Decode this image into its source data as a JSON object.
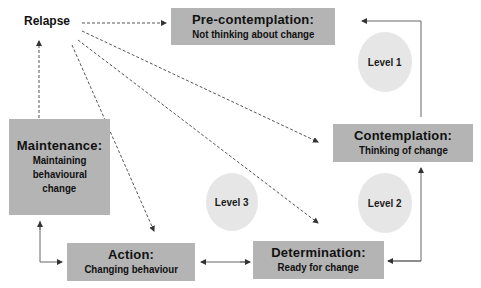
{
  "diagram": {
    "type": "stages-of-change cycle",
    "relapse_label": "Relapse",
    "stages": [
      {
        "id": "precontemplation",
        "title": "Pre-contemplation:",
        "subtitle": "Not thinking about change"
      },
      {
        "id": "contemplation",
        "title": "Contemplation:",
        "subtitle": "Thinking of change"
      },
      {
        "id": "determination",
        "title": "Determination:",
        "subtitle": "Ready for change"
      },
      {
        "id": "action",
        "title": "Action:",
        "subtitle": "Changing behaviour"
      },
      {
        "id": "maintenance",
        "title": "Maintenance:",
        "subtitle_lines": [
          "Maintaining",
          "behavioural",
          "change"
        ]
      }
    ],
    "levels": [
      {
        "label": "Level 1"
      },
      {
        "label": "Level 2"
      },
      {
        "label": "Level 3"
      }
    ],
    "connections": [
      {
        "from": "contemplation",
        "to": "precontemplation",
        "style": "solid"
      },
      {
        "from": "determination",
        "to": "contemplation",
        "style": "solid"
      },
      {
        "from": "determination",
        "to": "action",
        "style": "solid-double"
      },
      {
        "from": "maintenance",
        "to": "action",
        "style": "solid-double"
      },
      {
        "from": "maintenance",
        "to": "relapse",
        "style": "dashed"
      },
      {
        "from": "relapse",
        "to": "precontemplation",
        "style": "dashed"
      },
      {
        "from": "relapse",
        "to": "contemplation",
        "style": "dashed"
      },
      {
        "from": "relapse",
        "to": "determination",
        "style": "dashed"
      },
      {
        "from": "relapse",
        "to": "action",
        "style": "dashed"
      }
    ],
    "colors": {
      "box_fill": "#b4b4b4",
      "level_fill": "#e6e6e6",
      "line": "#555555",
      "text": "#111111"
    }
  }
}
